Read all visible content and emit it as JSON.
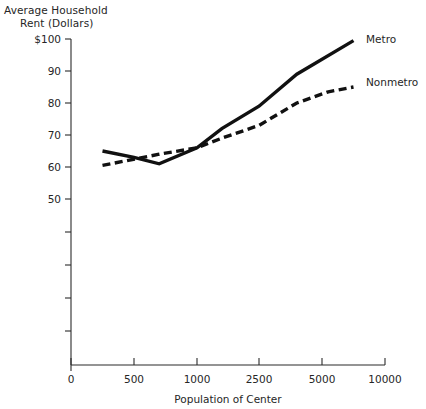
{
  "chart_data": {
    "type": "line",
    "title": "",
    "subtitle": "",
    "ylabel_line1": "Average Household",
    "ylabel_line2": "Rent (Dollars)",
    "xlabel": "Population of Center",
    "x_tick_labels": [
      "0",
      "500",
      "1000",
      "2500",
      "5000",
      "10000"
    ],
    "x_tick_values": [
      0,
      500,
      1000,
      2500,
      5000,
      10000
    ],
    "y_tick_labels": [
      "$100",
      "90",
      "80",
      "70",
      "60",
      "50"
    ],
    "y_tick_values": [
      100,
      90,
      80,
      70,
      60,
      50
    ],
    "ylim": [
      20,
      100
    ],
    "xlim": [
      0,
      10000
    ],
    "grid": false,
    "legend_position": "right-inline",
    "series": [
      {
        "name": "Metro",
        "style": "solid",
        "color": "#111111",
        "x": [
          250,
          500,
          700,
          1000,
          1600,
          2500,
          4000,
          7500
        ],
        "values": [
          65,
          63,
          61,
          66,
          72,
          79,
          89,
          99.5
        ]
      },
      {
        "name": "Nonmetro",
        "style": "dashed",
        "color": "#111111",
        "x": [
          250,
          700,
          1000,
          1600,
          2500,
          4000,
          5500,
          7500
        ],
        "values": [
          60.5,
          64,
          66,
          69,
          73,
          80,
          83.5,
          85
        ]
      }
    ],
    "annotations": [
      {
        "text": "Metro",
        "x": 7500,
        "y": 99.5
      },
      {
        "text": "Nonmetro",
        "x": 7500,
        "y": 85
      }
    ]
  }
}
